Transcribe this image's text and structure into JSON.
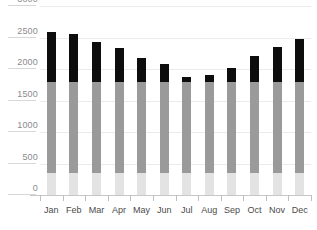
{
  "chart_data": {
    "type": "bar",
    "title": "",
    "subtitle": "",
    "xlabel": "",
    "ylabel": "",
    "categories": [
      "Jan",
      "Feb",
      "Mar",
      "Apr",
      "May",
      "Jun",
      "Jul",
      "Aug",
      "Sep",
      "Oct",
      "Nov",
      "Dec"
    ],
    "ylim": [
      0,
      3000
    ],
    "yticks": [
      0,
      500,
      1000,
      1500,
      2000,
      2500,
      3000
    ],
    "ytick_labels": [
      "0",
      "500",
      "1000",
      "1500",
      "2000",
      "2500",
      "3000"
    ],
    "grid": true,
    "legend": "none",
    "stacked": true,
    "series": [
      {
        "name": "base",
        "color": "#e3e3e3",
        "values": [
          345,
          345,
          345,
          345,
          345,
          345,
          345,
          345,
          345,
          345,
          345,
          345
        ]
      },
      {
        "name": "middle",
        "color": "#9a9a9a",
        "values": [
          1445,
          1445,
          1445,
          1445,
          1445,
          1445,
          1445,
          1445,
          1445,
          1445,
          1445,
          1445
        ]
      },
      {
        "name": "top",
        "color": "#0d0d0d",
        "values": [
          790,
          765,
          640,
          540,
          390,
          290,
          80,
          110,
          220,
          410,
          560,
          680
        ]
      }
    ],
    "totals": [
      2580,
      2555,
      2430,
      2330,
      2180,
      2080,
      1870,
      1900,
      2010,
      2200,
      2350,
      2470
    ],
    "segment_boundaries": {
      "base_top": 345,
      "middle_top": 1790
    }
  },
  "axes": {
    "y_axis_name": "y-axis",
    "x_axis_name": "x-axis",
    "baseline_color": "#c8c6c6",
    "gridline_color": "#eceaea",
    "tick_color": "#c0bebe",
    "ytick_text_color": "#8b8b8b",
    "xtick_text_color": "#4a4a4a"
  },
  "background": "#ffffff"
}
